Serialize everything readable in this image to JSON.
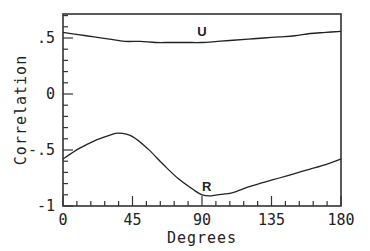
{
  "chart_data": {
    "type": "line",
    "title": "",
    "xlabel": "Degrees",
    "ylabel": "Correlation",
    "xlim": [
      0,
      180
    ],
    "ylim": [
      -1,
      0.71
    ],
    "grid": false,
    "legend": "none (curves labeled inline)",
    "x_ticks": [
      0,
      45,
      90,
      135,
      180
    ],
    "x_tick_labels": [
      "0",
      "45",
      "90",
      "135",
      "180"
    ],
    "x_minor_step": 9,
    "y_ticks": [
      -1,
      -0.5,
      0,
      0.5
    ],
    "y_tick_labels": [
      "-1",
      "-.5",
      "0",
      ".5"
    ],
    "y_minor_step": 0.1,
    "series": [
      {
        "name": "U",
        "label_at": [
          90,
          0.52
        ],
        "x": [
          0,
          10,
          20,
          30,
          40,
          50,
          60,
          70,
          80,
          90,
          100,
          110,
          120,
          130,
          140,
          150,
          160,
          170,
          180
        ],
        "values": [
          0.55,
          0.53,
          0.51,
          0.49,
          0.47,
          0.47,
          0.46,
          0.46,
          0.46,
          0.46,
          0.47,
          0.48,
          0.49,
          0.5,
          0.51,
          0.52,
          0.54,
          0.55,
          0.56
        ]
      },
      {
        "name": "R",
        "label_at": [
          93,
          -0.87
        ],
        "x": [
          0,
          10,
          20,
          30,
          36,
          45,
          55,
          65,
          75,
          85,
          90,
          95,
          100,
          110,
          120,
          130,
          140,
          150,
          160,
          170,
          180
        ],
        "values": [
          -0.58,
          -0.49,
          -0.42,
          -0.37,
          -0.35,
          -0.38,
          -0.49,
          -0.63,
          -0.76,
          -0.86,
          -0.9,
          -0.91,
          -0.9,
          -0.88,
          -0.83,
          -0.79,
          -0.75,
          -0.71,
          -0.67,
          -0.63,
          -0.58
        ]
      }
    ]
  }
}
